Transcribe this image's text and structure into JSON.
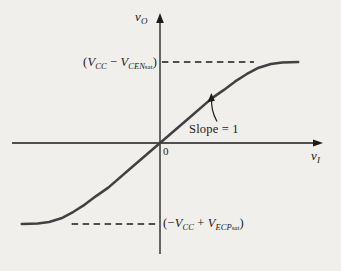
{
  "figure": {
    "bg_color": "#f1efeb",
    "curve_color": "#414143",
    "axis_color": "#1b1b1b"
  },
  "labels": {
    "y_axis": {
      "base": "v",
      "sub": "O"
    },
    "x_axis": {
      "base": "v",
      "sub": "I"
    },
    "origin": "0",
    "slope_note": "Slope = 1",
    "upper_level": {
      "open_paren": "(",
      "v1": "V",
      "v1_sub": "CC",
      "operator": " − ",
      "v2": "V",
      "v2_sub": "CEN",
      "v2_sub_small": "sat",
      "close_paren": ")"
    },
    "lower_level": {
      "open_paren": "(−",
      "v1": "V",
      "v1_sub": "CC",
      "operator": " + ",
      "v2": "V",
      "v2_sub": "ECP",
      "v2_sub_small": "sat",
      "close_paren": ")"
    }
  },
  "chart_data": {
    "type": "line",
    "title": "",
    "xlabel": "v_I",
    "ylabel": "v_O",
    "grid": false,
    "units": "qualitative; saturation levels normalized to ±1",
    "upper_asymptote_label": "(V_CC − V_CENsat)",
    "lower_asymptote_label": "(−V_CC + V_ECPsat)",
    "slope_at_origin": 1,
    "xlim": [
      -1.57,
      1.73
    ],
    "ylim": [
      -1.38,
      1.6
    ],
    "series": [
      {
        "name": "voltage transfer characteristic",
        "x": [
          -1.47,
          -1.3,
          -1.18,
          -1.05,
          -0.92,
          -0.8,
          -0.68,
          -0.55,
          -0.3,
          0,
          0.3,
          0.55,
          0.68,
          0.8,
          0.92,
          1.05,
          1.18,
          1.3,
          1.47
        ],
        "y": [
          -1,
          -0.995,
          -0.975,
          -0.93,
          -0.85,
          -0.76,
          -0.655,
          -0.55,
          -0.3,
          0,
          0.3,
          0.55,
          0.655,
          0.76,
          0.85,
          0.93,
          0.975,
          0.995,
          1
        ]
      }
    ],
    "asymptote_lines": [
      {
        "y": 1,
        "x_start": 0.02,
        "x_end": 1.0
      },
      {
        "y": -1,
        "x_start": -0.94,
        "x_end": -0.01
      }
    ]
  }
}
